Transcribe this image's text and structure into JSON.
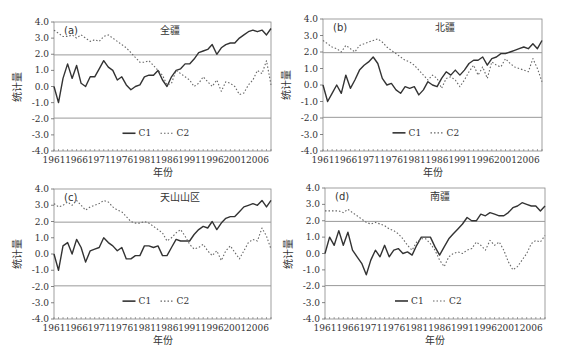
{
  "chart_data": [
    {
      "type": "line",
      "panel": "(a)",
      "title": "全疆",
      "xlabel": "年份",
      "ylabel": "统计量",
      "ylim": [
        -4.0,
        4.0
      ],
      "xlim": [
        1961,
        2009
      ],
      "yticks": [
        "4.0",
        "3.0",
        "2.0",
        "1.0",
        "0.0",
        "-1.0",
        "-2.0",
        "-3.0",
        "-4.0"
      ],
      "xticks": [
        "1961",
        "1966",
        "1971",
        "1976",
        "1981",
        "1986",
        "1991",
        "1996",
        "2001",
        "2006"
      ],
      "reference_lines": [
        1.96,
        -1.96
      ],
      "legend": [
        "C1",
        "C2"
      ],
      "legend_position": "bottom-center",
      "x": [
        1961,
        1962,
        1963,
        1964,
        1965,
        1966,
        1967,
        1968,
        1969,
        1970,
        1971,
        1972,
        1973,
        1974,
        1975,
        1976,
        1977,
        1978,
        1979,
        1980,
        1981,
        1982,
        1983,
        1984,
        1985,
        1986,
        1987,
        1988,
        1989,
        1990,
        1991,
        1992,
        1993,
        1994,
        1995,
        1996,
        1997,
        1998,
        1999,
        2000,
        2001,
        2002,
        2003,
        2004,
        2005,
        2006,
        2007,
        2008,
        2009
      ],
      "series": [
        {
          "name": "C1",
          "style": "solid",
          "values": [
            0.0,
            -1.0,
            0.5,
            1.4,
            0.5,
            1.3,
            0.2,
            0.0,
            0.6,
            0.6,
            1.1,
            1.6,
            1.2,
            1.0,
            0.4,
            0.6,
            0.1,
            -0.2,
            0.0,
            0.1,
            0.6,
            0.7,
            0.7,
            1.0,
            0.4,
            0.0,
            0.6,
            1.0,
            1.1,
            1.4,
            1.4,
            1.7,
            2.1,
            2.2,
            2.3,
            2.6,
            2.0,
            2.4,
            2.6,
            2.7,
            2.7,
            3.0,
            3.2,
            3.4,
            3.5,
            3.4,
            3.5,
            3.2,
            3.6
          ]
        },
        {
          "name": "C2",
          "style": "dotted",
          "values": [
            3.5,
            3.3,
            3.1,
            3.1,
            3.2,
            3.0,
            3.2,
            3.0,
            2.8,
            2.9,
            2.8,
            3.1,
            3.2,
            3.0,
            2.8,
            2.6,
            2.4,
            2.1,
            1.8,
            1.5,
            1.5,
            1.6,
            1.3,
            1.0,
            0.7,
            0.1,
            0.2,
            1.0,
            0.8,
            0.6,
            0.4,
            0.0,
            0.2,
            0.6,
            0.3,
            0.0,
            0.4,
            -0.3,
            0.3,
            0.2,
            0.0,
            -0.5,
            -0.4,
            0.1,
            0.4,
            1.0,
            0.8,
            1.6,
            0.1
          ]
        }
      ]
    },
    {
      "type": "line",
      "panel": "(b)",
      "title": "北疆",
      "xlabel": "年份",
      "ylabel": "统计量",
      "ylim": [
        -4.0,
        4.0
      ],
      "xlim": [
        1961,
        2009
      ],
      "yticks": [
        "4.0",
        "3.0",
        "2.0",
        "1.0",
        "0.0",
        "-1.0",
        "-2.0",
        "-3.0",
        "-4.0"
      ],
      "xticks": [
        "1961",
        "1966",
        "1971",
        "1976",
        "1981",
        "1986",
        "1991",
        "1996",
        "2001",
        "2006"
      ],
      "reference_lines": [
        1.96,
        -1.96
      ],
      "legend": [
        "C1",
        "C2"
      ],
      "legend_position": "bottom-center",
      "x": [
        1961,
        1962,
        1963,
        1964,
        1965,
        1966,
        1967,
        1968,
        1969,
        1970,
        1971,
        1972,
        1973,
        1974,
        1975,
        1976,
        1977,
        1978,
        1979,
        1980,
        1981,
        1982,
        1983,
        1984,
        1985,
        1986,
        1987,
        1988,
        1989,
        1990,
        1991,
        1992,
        1993,
        1994,
        1995,
        1996,
        1997,
        1998,
        1999,
        2000,
        2001,
        2002,
        2003,
        2004,
        2005,
        2006,
        2007,
        2008,
        2009
      ],
      "series": [
        {
          "name": "C1",
          "style": "solid",
          "values": [
            0.0,
            -1.0,
            -0.5,
            0.0,
            -0.5,
            0.6,
            -0.2,
            0.3,
            0.9,
            1.2,
            1.4,
            1.7,
            1.3,
            0.4,
            0.0,
            0.1,
            -0.3,
            -0.5,
            -0.1,
            -0.2,
            -0.1,
            -0.6,
            -0.3,
            0.2,
            0.0,
            -0.1,
            0.4,
            0.8,
            0.6,
            0.9,
            0.6,
            0.9,
            1.3,
            1.5,
            1.5,
            1.7,
            1.2,
            1.6,
            1.7,
            1.9,
            1.9,
            2.0,
            2.1,
            2.2,
            2.3,
            2.2,
            2.5,
            2.2,
            2.7
          ]
        },
        {
          "name": "C2",
          "style": "dotted",
          "values": [
            2.7,
            2.5,
            2.3,
            2.2,
            2.0,
            2.4,
            2.2,
            2.0,
            2.4,
            2.5,
            2.6,
            2.7,
            2.8,
            2.6,
            2.3,
            2.1,
            1.9,
            1.7,
            1.5,
            1.4,
            1.2,
            0.9,
            0.6,
            0.3,
            0.6,
            0.4,
            -0.2,
            0.4,
            0.5,
            0.3,
            -0.1,
            0.3,
            0.8,
            1.2,
            0.6,
            1.1,
            0.4,
            1.4,
            1.2,
            1.1,
            1.6,
            1.3,
            1.1,
            1.0,
            0.9,
            0.8,
            1.6,
            1.0,
            0.2
          ]
        }
      ]
    },
    {
      "type": "line",
      "panel": "(c)",
      "title": "天山山区",
      "xlabel": "年份",
      "ylabel": "统计量",
      "ylim": [
        -4.0,
        4.0
      ],
      "xlim": [
        1961,
        2009
      ],
      "yticks": [
        "4.0",
        "3.0",
        "2.0",
        "1.0",
        "0.0",
        "-1.0",
        "-2.0",
        "-3.0",
        "-4.0"
      ],
      "xticks": [
        "1961",
        "1966",
        "1971",
        "1976",
        "1981",
        "1986",
        "1991",
        "1996",
        "2001",
        "2006"
      ],
      "reference_lines": [
        1.96,
        -1.96
      ],
      "legend": [
        "C1",
        "C2"
      ],
      "legend_position": "bottom-center",
      "x": [
        1961,
        1962,
        1963,
        1964,
        1965,
        1966,
        1967,
        1968,
        1969,
        1970,
        1971,
        1972,
        1973,
        1974,
        1975,
        1976,
        1977,
        1978,
        1979,
        1980,
        1981,
        1982,
        1983,
        1984,
        1985,
        1986,
        1987,
        1988,
        1989,
        1990,
        1991,
        1992,
        1993,
        1994,
        1995,
        1996,
        1997,
        1998,
        1999,
        2000,
        2001,
        2002,
        2003,
        2004,
        2005,
        2006,
        2007,
        2008,
        2009
      ],
      "series": [
        {
          "name": "C1",
          "style": "solid",
          "values": [
            0.0,
            -1.0,
            0.5,
            0.7,
            0.0,
            0.9,
            0.4,
            -0.5,
            0.2,
            0.3,
            0.4,
            1.0,
            0.7,
            0.5,
            0.2,
            0.4,
            -0.3,
            -0.3,
            -0.1,
            -0.1,
            0.5,
            0.5,
            0.4,
            0.5,
            -0.1,
            -0.1,
            0.4,
            0.9,
            0.8,
            0.8,
            0.8,
            1.2,
            1.5,
            1.7,
            1.6,
            2.0,
            1.5,
            1.9,
            2.2,
            2.3,
            2.3,
            2.6,
            2.9,
            3.0,
            3.1,
            3.0,
            3.3,
            2.9,
            3.3
          ]
        },
        {
          "name": "C2",
          "style": "dotted",
          "values": [
            3.1,
            2.9,
            3.0,
            3.2,
            3.0,
            3.3,
            3.0,
            2.7,
            2.9,
            3.0,
            3.1,
            3.3,
            3.2,
            2.9,
            2.7,
            2.6,
            2.3,
            2.0,
            1.9,
            1.9,
            2.0,
            1.9,
            1.7,
            1.5,
            1.3,
            0.8,
            1.0,
            1.3,
            1.5,
            1.1,
            0.6,
            0.3,
            0.4,
            0.6,
            0.2,
            -0.1,
            0.2,
            -0.4,
            0.2,
            0.5,
            0.1,
            -0.3,
            0.2,
            0.7,
            0.9,
            0.8,
            1.6,
            1.1,
            0.3
          ]
        }
      ]
    },
    {
      "type": "line",
      "panel": "(d)",
      "title": "南疆",
      "xlabel": "年份",
      "ylabel": "统计量",
      "ylim": [
        -4.0,
        4.0
      ],
      "xlim": [
        1961,
        2009
      ],
      "yticks": [
        "4.0",
        "3.0",
        "2.0",
        "1.0",
        "0.0",
        "-1.0",
        "-2.0",
        "-3.0",
        "-4.0"
      ],
      "xticks": [
        "1961",
        "1966",
        "1971",
        "1976",
        "1981",
        "1986",
        "1991",
        "1996",
        "2001",
        "2006"
      ],
      "reference_lines": [
        1.96,
        -1.96
      ],
      "legend": [
        "C1",
        "C2"
      ],
      "legend_position": "bottom-center",
      "x": [
        1961,
        1962,
        1963,
        1964,
        1965,
        1966,
        1967,
        1968,
        1969,
        1970,
        1971,
        1972,
        1973,
        1974,
        1975,
        1976,
        1977,
        1978,
        1979,
        1980,
        1981,
        1982,
        1983,
        1984,
        1985,
        1986,
        1987,
        1988,
        1989,
        1990,
        1991,
        1992,
        1993,
        1994,
        1995,
        1996,
        1997,
        1998,
        1999,
        2000,
        2001,
        2002,
        2003,
        2004,
        2005,
        2006,
        2007,
        2008,
        2009
      ],
      "series": [
        {
          "name": "C1",
          "style": "solid",
          "values": [
            0.0,
            1.0,
            0.5,
            1.4,
            0.5,
            1.3,
            0.2,
            -0.2,
            -0.6,
            -1.3,
            -0.4,
            0.2,
            -0.2,
            0.5,
            -0.2,
            0.2,
            0.3,
            0.0,
            0.1,
            -0.1,
            0.5,
            1.0,
            1.0,
            1.0,
            0.4,
            -0.1,
            0.4,
            0.9,
            1.2,
            1.5,
            1.8,
            2.2,
            2.0,
            2.0,
            2.4,
            2.3,
            2.5,
            2.4,
            2.3,
            2.3,
            2.5,
            2.8,
            2.9,
            3.1,
            3.0,
            2.9,
            2.9,
            2.6,
            2.9
          ]
        },
        {
          "name": "C2",
          "style": "dotted",
          "values": [
            2.6,
            2.6,
            2.6,
            2.6,
            2.5,
            2.7,
            2.5,
            2.3,
            2.1,
            1.9,
            1.8,
            1.9,
            1.8,
            1.7,
            1.5,
            1.4,
            1.2,
            0.9,
            0.5,
            0.2,
            0.7,
            0.9,
            0.9,
            0.6,
            0.2,
            -0.4,
            -0.8,
            -0.2,
            0.0,
            0.1,
            0.0,
            0.2,
            0.3,
            0.7,
            0.5,
            0.2,
            0.8,
            0.5,
            0.7,
            0.2,
            -0.5,
            -1.0,
            -0.8,
            -0.4,
            0.0,
            0.6,
            0.8,
            0.7,
            1.1,
            0.3
          ]
        }
      ]
    }
  ]
}
